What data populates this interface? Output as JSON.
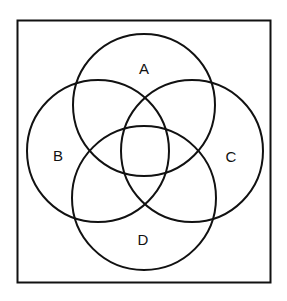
{
  "diagram": {
    "type": "venn",
    "frame": {
      "x": 17,
      "y": 20,
      "width": 253,
      "height": 262
    },
    "stroke_color": "#111111",
    "sets": [
      {
        "label": "A",
        "cx": 144,
        "cy": 105,
        "r": 71,
        "label_x": 144,
        "label_y": 68
      },
      {
        "label": "B",
        "cx": 98,
        "cy": 151,
        "r": 71,
        "label_x": 58,
        "label_y": 155
      },
      {
        "label": "C",
        "cx": 192,
        "cy": 151,
        "r": 71,
        "label_x": 231,
        "label_y": 156
      },
      {
        "label": "D",
        "cx": 144,
        "cy": 198,
        "r": 72,
        "label_x": 143,
        "label_y": 239
      }
    ]
  }
}
